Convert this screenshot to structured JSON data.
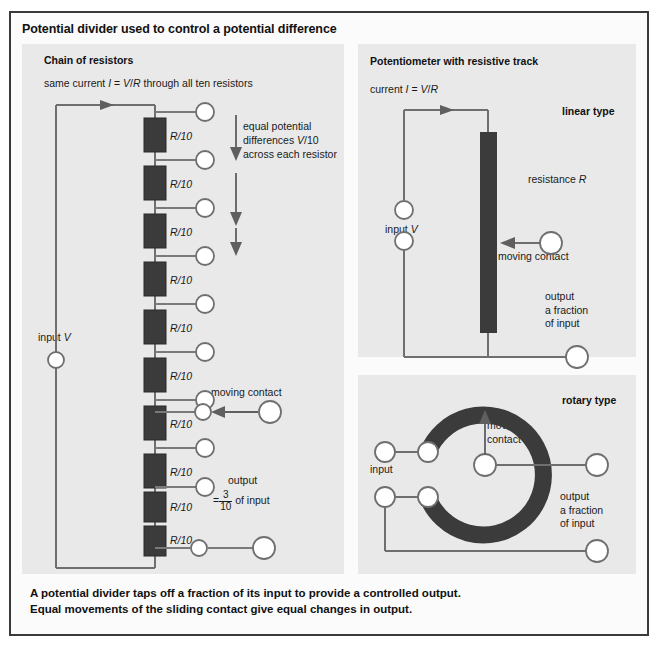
{
  "title": "Potential divider used to control a potential difference",
  "panels": {
    "chain": {
      "heading": "Chain of resistors",
      "current_note": "same current I = V/R through all ten resistors",
      "resistor_label": "R/10",
      "resistor_count": 10,
      "equal_note_line1": "equal potential",
      "equal_note_line2": "differences V/10",
      "equal_note_line3": "across each resistor",
      "input_label": "input V",
      "moving_contact_label": "moving contact",
      "output_label": "output",
      "output_eq": "=",
      "output_num": "3",
      "output_den": "10",
      "output_suffix": "of input"
    },
    "linear": {
      "heading": "Potentiometer with resistive track",
      "current_note": "current I = V/R",
      "type_label": "linear type",
      "resistance_label": "resistance R",
      "input_label": "input V",
      "moving_contact_label": "moving contact",
      "output_line1": "output",
      "output_line2": "a fraction",
      "output_line3": "of input"
    },
    "rotary": {
      "type_label": "rotary type",
      "moving_contact_line1": "moving",
      "moving_contact_line2": "contact",
      "input_label": "input",
      "output_line1": "output",
      "output_line2": "a fraction",
      "output_line3": "of input"
    }
  },
  "caption_line1": "A potential divider taps off a fraction of its input to provide a controlled output.",
  "caption_line2": "Equal movements of the sliding contact give equal changes in output.",
  "colors": {
    "panel_bg": "#e9e9e9",
    "resistor": "#3b3b3b",
    "wire": "#6f6f6f",
    "border": "#3a3a3a"
  }
}
